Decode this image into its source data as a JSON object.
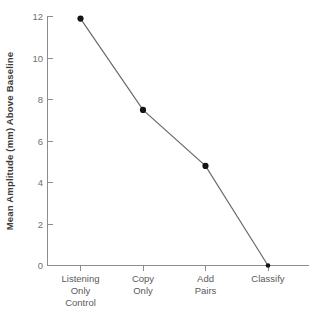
{
  "chart_data": {
    "type": "line",
    "title": "",
    "xlabel": "",
    "ylabel": "Mean Amplitude (mm) Above Baseline",
    "categories": [
      "Listening Only Control",
      "Copy Only",
      "Add Pairs",
      "Classify"
    ],
    "category_lines": [
      [
        "Listening",
        "Only",
        "Control"
      ],
      [
        "Copy",
        "Only"
      ],
      [
        "Add",
        "Pairs"
      ],
      [
        "Classify"
      ]
    ],
    "values": [
      11.9,
      7.5,
      4.8,
      0.0
    ],
    "series": [
      {
        "name": "Mean Amplitude Above Baseline",
        "values": [
          11.9,
          7.5,
          4.8,
          0.0
        ]
      }
    ],
    "ylim": [
      0,
      12
    ],
    "yticks": [
      0,
      2,
      4,
      6,
      8,
      10,
      12
    ],
    "ytick_labels": [
      "0",
      "2",
      "4",
      "6",
      "8",
      "10",
      "12"
    ],
    "grid": false,
    "legend": "none",
    "marker": "filled-circle",
    "line_color": "#6a6a6a",
    "marker_color": "#141414",
    "axis_color": "#8c8c8c",
    "background_color": "#ffffff"
  },
  "axes": {
    "y_title": "Mean Amplitude (mm) Above Baseline",
    "y_tick_0": "0",
    "y_tick_1": "2",
    "y_tick_2": "4",
    "y_tick_3": "6",
    "y_tick_4": "8",
    "y_tick_5": "10",
    "y_tick_6": "12",
    "x_tick_0_line_0": "Listening",
    "x_tick_0_line_1": "Only",
    "x_tick_0_line_2": "Control",
    "x_tick_1_line_0": "Copy",
    "x_tick_1_line_1": "Only",
    "x_tick_2_line_0": "Add",
    "x_tick_2_line_1": "Pairs",
    "x_tick_3_line_0": "Classify"
  }
}
